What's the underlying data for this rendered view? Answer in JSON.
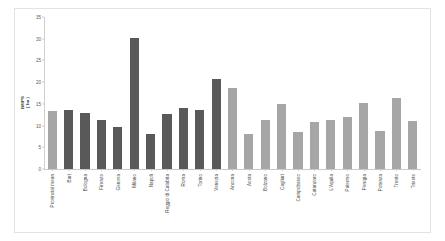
{
  "chart_data": {
    "type": "bar",
    "title": "",
    "xlabel": "",
    "ylabel": "BMPS\n( ha )",
    "ylabel_line1": "BMPS",
    "ylabel_line2": "( ha )",
    "ylim": [
      0,
      35
    ],
    "ytick_values": [
      0,
      5,
      10,
      15,
      20,
      25,
      30,
      35
    ],
    "ytick_labels": [
      "0",
      "5",
      "10",
      "15",
      "20",
      "25",
      "30",
      "35"
    ],
    "grid": false,
    "legend": "none",
    "colors": {
      "dark_bar": "#595959",
      "light_bar": "#a6a6a6",
      "axis": "#d0d0d0",
      "frame": "#e3e3e3",
      "background": "#ffffff",
      "text": "#4a4a4a"
    },
    "categories": [
      "Provincial mean",
      "Bari",
      "Bologna",
      "Firenze",
      "Genova",
      "Milano",
      "Napoli",
      "Reggio di Calabria",
      "Roma",
      "Torino",
      "Venezia",
      "Ancona",
      "Aosta",
      "Bolzano",
      "Cagliari",
      "Campobasso",
      "Catanzaro",
      "L'Aquila",
      "Palermo",
      "Perugia",
      "Potenza",
      "Trento",
      "Trieste"
    ],
    "values": [
      13.4,
      13.7,
      12.9,
      11.2,
      9.6,
      30.2,
      8.0,
      12.7,
      14.0,
      13.6,
      20.8,
      18.6,
      8.0,
      11.4,
      15.0,
      8.6,
      10.9,
      11.3,
      11.9,
      15.2,
      8.8,
      16.4,
      11.0
    ],
    "bar_colors": [
      "#a6a6a6",
      "#595959",
      "#595959",
      "#595959",
      "#595959",
      "#595959",
      "#595959",
      "#595959",
      "#595959",
      "#595959",
      "#595959",
      "#a6a6a6",
      "#a6a6a6",
      "#a6a6a6",
      "#a6a6a6",
      "#a6a6a6",
      "#a6a6a6",
      "#a6a6a6",
      "#a6a6a6",
      "#a6a6a6",
      "#a6a6a6",
      "#a6a6a6",
      "#a6a6a6"
    ]
  }
}
